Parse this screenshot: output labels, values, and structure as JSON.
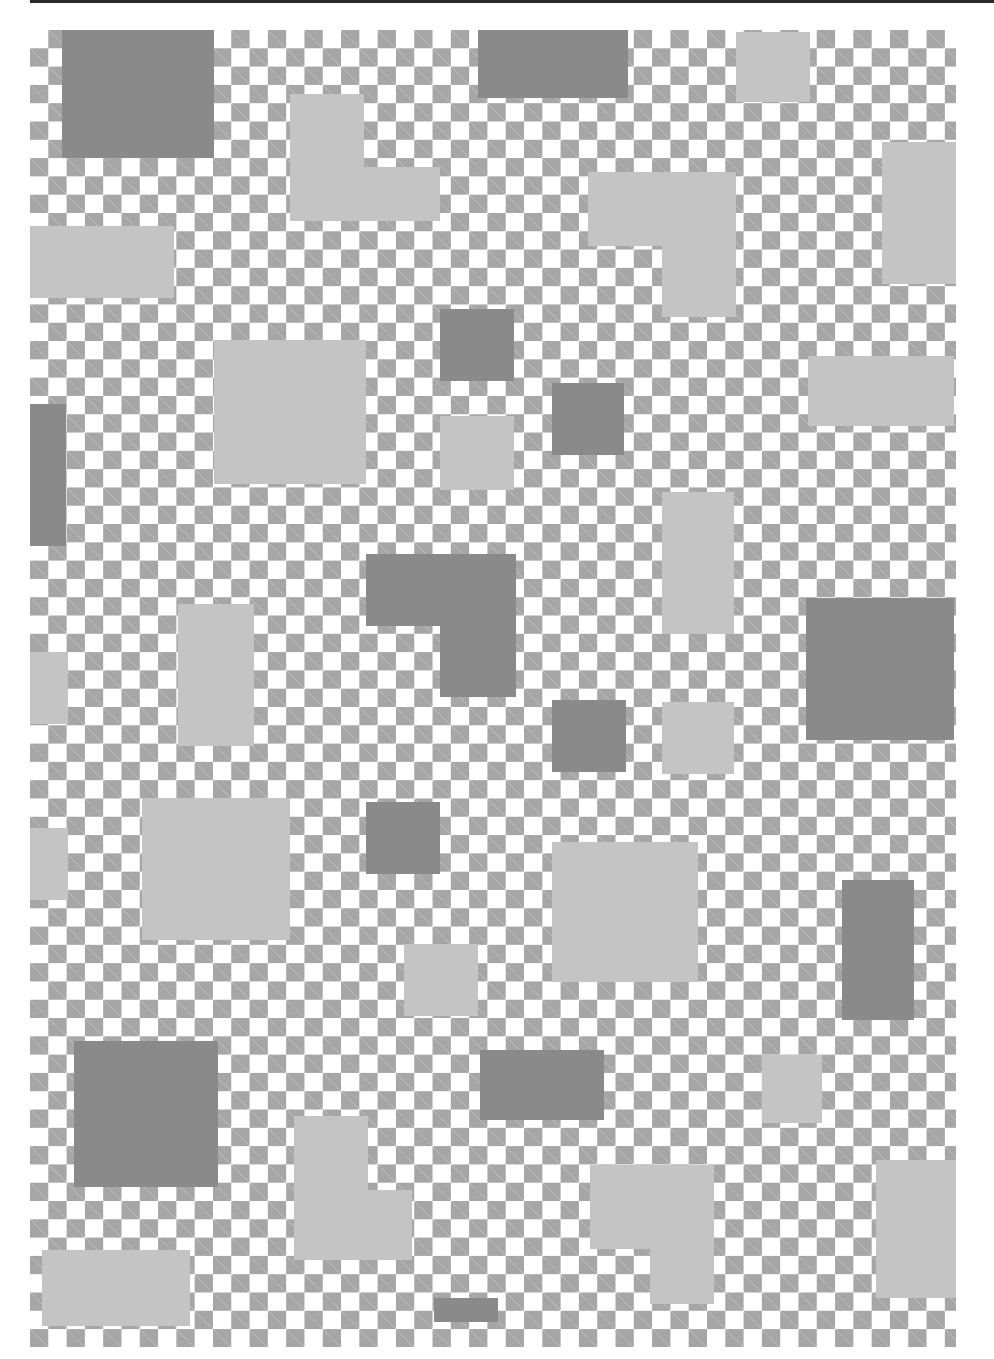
{
  "artwork": {
    "description": "Checkerboard composition with overlaid grey rectangles",
    "colors": {
      "background": "#ffffff",
      "checker": "#a6a6a6",
      "dark_block": "#8a8a8a",
      "light_block": "#c4c4c4",
      "top_rule": "#2a2a2a"
    },
    "checker_cell_px": 18.3
  }
}
